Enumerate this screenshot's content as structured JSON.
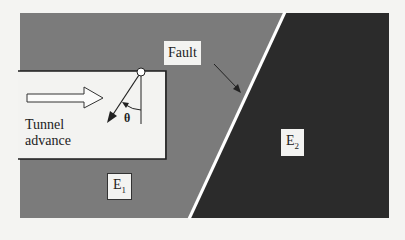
{
  "diagram": {
    "labels": {
      "fault": "Fault",
      "tunnel_line1": "Tunnel",
      "tunnel_line2": "advance",
      "theta": "θ",
      "e1_main": "E",
      "e1_sub": "1",
      "e2_main": "E",
      "e2_sub": "2"
    },
    "colors": {
      "background": "#f4f4f2",
      "rock_e1": "#7b7b7b",
      "rock_e2": "#2b2b2b",
      "fault_line": "#ffffff",
      "tunnel": "#f3f3f1",
      "ink": "#222222"
    }
  }
}
